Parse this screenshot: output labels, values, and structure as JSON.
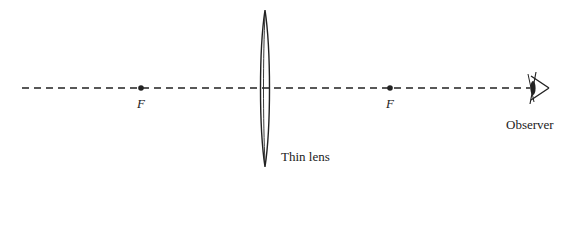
{
  "diagram": {
    "title": "",
    "colors": {
      "stroke": "#222222",
      "background": "#ffffff"
    },
    "optical_axis": {
      "style": "dashed",
      "y": 88,
      "x_start": 22,
      "x_end": 530
    },
    "lens": {
      "type": "thin convex lens",
      "label": "Thin lens",
      "center_x": 265
    },
    "focal_points": [
      {
        "id": "left",
        "label": "F",
        "x": 141
      },
      {
        "id": "right",
        "label": "F",
        "x": 390
      }
    ],
    "observer": {
      "label": "Observer",
      "icon": "eye-icon",
      "x": 533
    }
  }
}
